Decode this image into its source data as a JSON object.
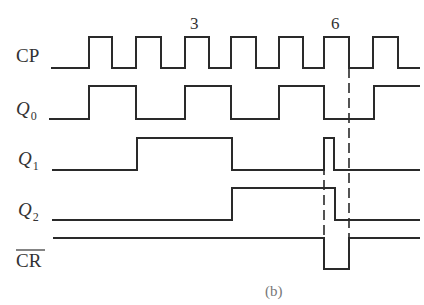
{
  "diagram": {
    "type": "timing-diagram",
    "caption": "(b)",
    "stroke_color": "#2a2a2a",
    "signals": [
      {
        "name": "CP",
        "label": "CP",
        "label_italic": false,
        "label_pos": [
          16,
          62
        ],
        "points": [
          [
            51,
            68
          ],
          [
            89,
            68
          ],
          [
            89,
            37
          ],
          [
            112,
            37
          ],
          [
            112,
            68
          ],
          [
            136,
            68
          ],
          [
            136,
            37
          ],
          [
            161,
            37
          ],
          [
            161,
            68
          ],
          [
            185,
            68
          ],
          [
            185,
            37
          ],
          [
            209,
            37
          ],
          [
            209,
            68
          ],
          [
            231,
            68
          ],
          [
            231,
            37
          ],
          [
            256,
            37
          ],
          [
            256,
            68
          ],
          [
            279,
            68
          ],
          [
            279,
            37
          ],
          [
            303,
            37
          ],
          [
            303,
            68
          ],
          [
            324,
            68
          ],
          [
            324,
            37
          ],
          [
            349,
            37
          ],
          [
            349,
            68
          ],
          [
            373,
            68
          ],
          [
            373,
            37
          ],
          [
            398,
            37
          ],
          [
            398,
            68
          ],
          [
            420,
            68
          ]
        ]
      },
      {
        "name": "Q0",
        "label": "Q",
        "subscript": "0",
        "label_italic": true,
        "label_pos": [
          16,
          115
        ],
        "points": [
          [
            49,
            119
          ],
          [
            89,
            119
          ],
          [
            89,
            86
          ],
          [
            136,
            86
          ],
          [
            136,
            119
          ],
          [
            185,
            119
          ],
          [
            185,
            86
          ],
          [
            231,
            86
          ],
          [
            231,
            119
          ],
          [
            279,
            119
          ],
          [
            279,
            86
          ],
          [
            324,
            86
          ],
          [
            324,
            119
          ],
          [
            374,
            119
          ],
          [
            374,
            86
          ],
          [
            420,
            86
          ]
        ]
      },
      {
        "name": "Q1",
        "label": "Q",
        "subscript": "1",
        "label_italic": true,
        "label_pos": [
          18,
          165
        ],
        "points": [
          [
            52,
            170
          ],
          [
            137,
            170
          ],
          [
            137,
            138
          ],
          [
            232,
            138
          ],
          [
            232,
            170
          ],
          [
            324,
            170
          ],
          [
            324,
            138
          ],
          [
            334,
            138
          ],
          [
            334,
            170
          ],
          [
            420,
            170
          ]
        ]
      },
      {
        "name": "Q2",
        "label": "Q",
        "subscript": "2",
        "label_italic": true,
        "label_pos": [
          18,
          216
        ],
        "points": [
          [
            52,
            220
          ],
          [
            232,
            220
          ],
          [
            232,
            188
          ],
          [
            335,
            188
          ],
          [
            335,
            220
          ],
          [
            420,
            220
          ]
        ]
      },
      {
        "name": "CR_bar",
        "label": "CR",
        "overbar": true,
        "label_italic": false,
        "label_pos": [
          16,
          267
        ],
        "points": [
          [
            53,
            238
          ],
          [
            324,
            238
          ],
          [
            324,
            269
          ],
          [
            349,
            269
          ],
          [
            349,
            238
          ],
          [
            420,
            238
          ]
        ]
      }
    ],
    "dashed_lines": [
      {
        "x": 324,
        "y1": 150,
        "y2": 269
      },
      {
        "x": 349,
        "y1": 68,
        "y2": 269
      }
    ],
    "markers": [
      {
        "text": "3",
        "x": 190,
        "y": 29
      },
      {
        "text": "6",
        "x": 331,
        "y": 29
      }
    ],
    "caption_pos": [
      265,
      296
    ]
  }
}
